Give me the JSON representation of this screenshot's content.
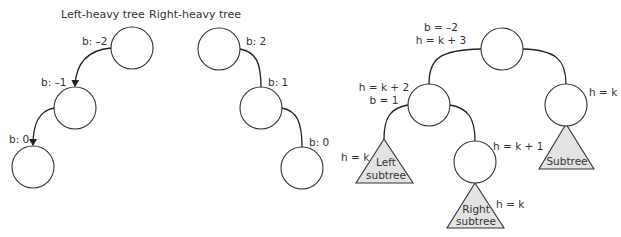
{
  "left_heavy": {
    "title": "Left-heavy tree",
    "nodes": [
      {
        "balance_label": "b: –2"
      },
      {
        "balance_label": "b: –1"
      },
      {
        "balance_label": "b: 0"
      }
    ]
  },
  "right_heavy": {
    "title": "Right-heavy tree",
    "nodes": [
      {
        "balance_label": "b: 2"
      },
      {
        "balance_label": "b: 1"
      },
      {
        "balance_label": "b: 0"
      }
    ]
  },
  "avl_example": {
    "root": {
      "balance": "b = –2",
      "height": "h = k + 3"
    },
    "left_child": {
      "height": "h = k + 2",
      "balance": "b = 1"
    },
    "right_child": {
      "height": "h = k"
    },
    "left_subtree": {
      "height": "h = k",
      "label_line1": "Left",
      "label_line2": "subtree"
    },
    "grandchild": {
      "height": "h = k + 1"
    },
    "right_subtree": {
      "height": "h = k",
      "label_line1": "Right",
      "label_line2": "subtree"
    },
    "right_child_subtree": {
      "label": "Subtree"
    }
  },
  "colors": {
    "stroke": "#333333",
    "subtree_fill": "#e3e3e3",
    "background": "#ffffff"
  }
}
